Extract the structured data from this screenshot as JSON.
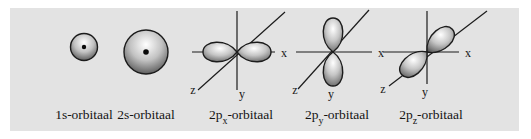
{
  "figure": {
    "page_background": "#ffffff",
    "panel_background": "#e3e3e3",
    "ink_color": "#1c1c1c"
  },
  "axis_labels": {
    "x": "x",
    "y": "y",
    "z": "z"
  },
  "orbitals": [
    {
      "id": "1s",
      "type": "sphere-small",
      "caption_pre": "1s-orbitaal",
      "caption_sub": "",
      "caption_post": ""
    },
    {
      "id": "2s",
      "type": "sphere-large",
      "caption_pre": "2s-orbitaal",
      "caption_sub": "",
      "caption_post": ""
    },
    {
      "id": "2px",
      "type": "dumbbell-x",
      "caption_pre": "2p",
      "caption_sub": "x",
      "caption_post": "-orbitaal"
    },
    {
      "id": "2py",
      "type": "dumbbell-y",
      "caption_pre": "2p",
      "caption_sub": "y",
      "caption_post": "-orbitaal"
    },
    {
      "id": "2pz",
      "type": "dumbbell-z",
      "caption_pre": "2p",
      "caption_sub": "z",
      "caption_post": "-orbitaal"
    }
  ]
}
